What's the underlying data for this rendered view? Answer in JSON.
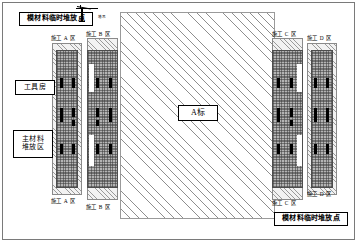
{
  "diagram": {
    "central_plot": {
      "label": "A标"
    },
    "colors": {
      "hatch_line": "#8e8e8e",
      "core_fill": "#b4b4b4",
      "unit_fill": "#000000",
      "frame": "#7a7a7a"
    }
  },
  "callouts": {
    "top_material_point": "模材料临时堆放点",
    "bottom_material_point": "模材料临时堆放点",
    "tool_room": "工具房",
    "main_material_area": "主材料\n堆放区"
  },
  "zones": {
    "a_top": "施工 A 区",
    "a_bottom": "施工 A 区",
    "b_top": "施工 B 区",
    "b_bottom": "施工 B 区",
    "c_top": "施工 C 区",
    "c_bottom": "施工 C 区",
    "d_top": "施工 D 区",
    "d_bottom": "施工 D 区"
  },
  "equipment": {
    "crane_top_tag": "塔吊",
    "crane_bottom_tag": "塔吊"
  }
}
